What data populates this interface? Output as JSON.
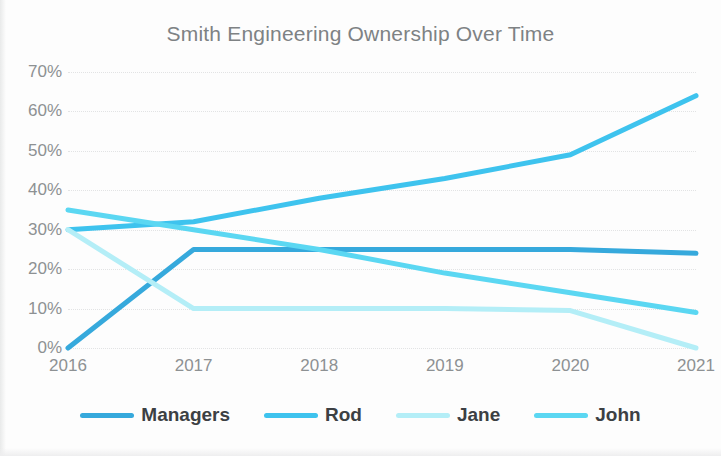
{
  "chart_data": {
    "type": "line",
    "title": "Smith Engineering Ownership Over Time",
    "xlabel": "",
    "ylabel": "",
    "categories": [
      "2016",
      "2017",
      "2018",
      "2019",
      "2020",
      "2021"
    ],
    "x": [
      2016,
      2017,
      2018,
      2019,
      2020,
      2021
    ],
    "ylim": [
      0,
      70
    ],
    "yticks": [
      0,
      10,
      20,
      30,
      40,
      50,
      60,
      70
    ],
    "ytick_labels": [
      "0%",
      "10%",
      "20%",
      "30%",
      "40%",
      "50%",
      "60%",
      "70%"
    ],
    "y_unit": "%",
    "grid": true,
    "grid_style": "dotted horizontal",
    "legend_position": "bottom",
    "series": [
      {
        "name": "Managers",
        "color": "#36A9DC",
        "values": [
          0,
          25,
          25,
          25,
          25,
          24
        ]
      },
      {
        "name": "Rod",
        "color": "#3EC3EE",
        "values": [
          30,
          32,
          38,
          43,
          49,
          64
        ]
      },
      {
        "name": "Jane",
        "color": "#B4EEF7",
        "values": [
          30,
          10,
          10,
          10,
          9.5,
          0
        ]
      },
      {
        "name": "John",
        "color": "#5BD7F2",
        "values": [
          35,
          30,
          25,
          19,
          14,
          9
        ]
      }
    ]
  },
  "colors": {
    "background": "#fdfdfd",
    "title_text": "#7e8284",
    "axis_text": "#8d9193",
    "legend_text": "#3c4043",
    "gridline": "#e2e3e4"
  },
  "legend": {
    "items": [
      {
        "label": "Managers",
        "color": "#36A9DC"
      },
      {
        "label": "Rod",
        "color": "#3EC3EE"
      },
      {
        "label": "Jane",
        "color": "#B4EEF7"
      },
      {
        "label": "John",
        "color": "#5BD7F2"
      }
    ]
  }
}
